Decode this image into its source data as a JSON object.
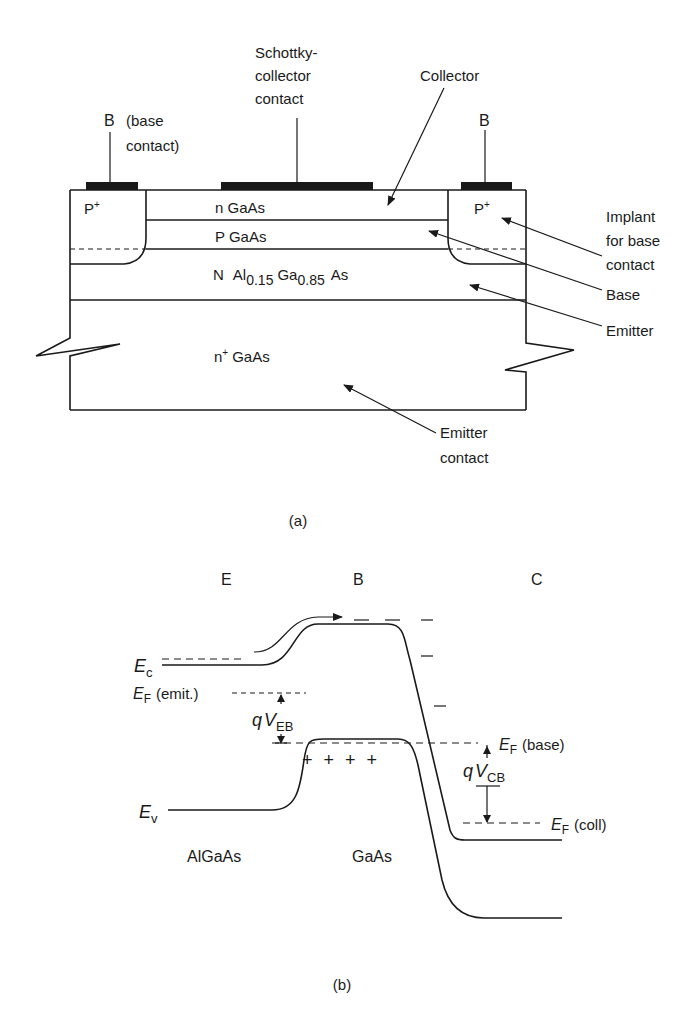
{
  "figure_a": {
    "caption": "(a)",
    "labels": {
      "base_contact_left_B": "B",
      "base_contact_left_desc_1": "(base",
      "base_contact_left_desc_2": "contact)",
      "schottky_1": "Schottky-",
      "schottky_2": "collector",
      "schottky_3": "contact",
      "collector": "Collector",
      "base_contact_right_B": "B",
      "implant_1": "Implant",
      "implant_2": "for base",
      "implant_3": "contact",
      "base": "Base",
      "emitter": "Emitter",
      "emitter_contact_1": "Emitter",
      "emitter_contact_2": "contact"
    },
    "layers": {
      "p_plus_left": "P",
      "p_plus_right": "P",
      "plus_sup": "+",
      "n_gaas": "n GaAs",
      "p_gaas": "P GaAs",
      "algaas_N": "N",
      "algaas_Al": "Al",
      "algaas_al_sub": "0.15",
      "algaas_Ga": "Ga",
      "algaas_ga_sub": "0.85",
      "algaas_As": "As",
      "substrate_n": "n",
      "substrate_sup": "+",
      "substrate_rest": "GaAs"
    }
  },
  "figure_b": {
    "caption": "(b)",
    "regions": {
      "E": "E",
      "B": "B",
      "C": "C"
    },
    "labels": {
      "Ec_E": "E",
      "Ec_sub": "c",
      "EF_emit_E": "E",
      "EF_emit_sub": "F",
      "EF_emit_text": "(emit.)",
      "qVEB_q": "q",
      "qVEB_V": "V",
      "qVEB_sub": "EB",
      "EF_base_E": "E",
      "EF_base_sub": "F",
      "EF_base_text": "(base)",
      "qVCB_q": "q",
      "qVCB_V": "V",
      "qVCB_sub": "CB",
      "Ev_E": "E",
      "Ev_sub": "v",
      "EF_coll_E": "E",
      "EF_coll_sub": "F",
      "EF_coll_text": "(coll)",
      "holes": "+ + + +",
      "algaas": "AlGaAs",
      "gaas": "GaAs"
    }
  }
}
